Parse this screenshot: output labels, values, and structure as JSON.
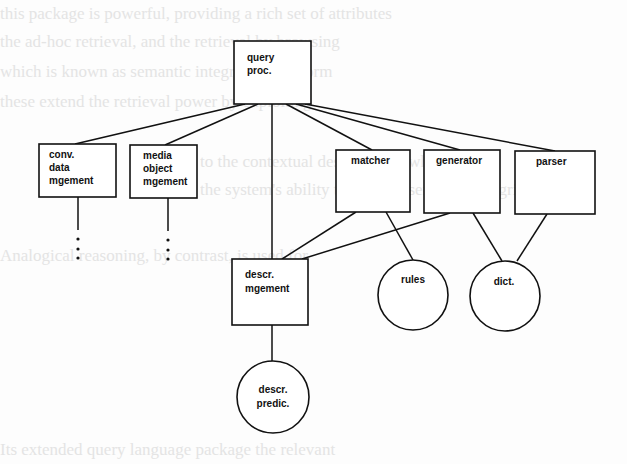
{
  "background_bleed_lines": [
    "this package is powerful, providing a rich set of attributes",
    "the ad-hoc retrieval, and the retrieval by browsing",
    "which is known as semantic integrity in the form",
    "these extend the retrieval power by exploiting",
    "to the contextual descriptions, which assist",
    "the system's ability to manage semantic integrity",
    "Analogical reasoning, by contrast, is used for",
    "Its extended query language package the relevant"
  ],
  "diagram": {
    "nodes": [
      {
        "id": "query_proc",
        "shape": "box",
        "lines": [
          "query",
          "proc."
        ]
      },
      {
        "id": "conv_data",
        "shape": "box",
        "lines": [
          "conv.",
          "data",
          "mgement"
        ]
      },
      {
        "id": "media_object",
        "shape": "box",
        "lines": [
          "media",
          "object",
          "mgement"
        ]
      },
      {
        "id": "matcher",
        "shape": "box",
        "lines": [
          "matcher"
        ]
      },
      {
        "id": "generator",
        "shape": "box",
        "lines": [
          "generator"
        ]
      },
      {
        "id": "parser",
        "shape": "box",
        "lines": [
          "parser"
        ]
      },
      {
        "id": "descr_mgement",
        "shape": "box",
        "lines": [
          "descr.",
          "mgement"
        ]
      },
      {
        "id": "rules",
        "shape": "circle",
        "lines": [
          "rules"
        ]
      },
      {
        "id": "dict",
        "shape": "circle",
        "lines": [
          "dict."
        ]
      },
      {
        "id": "descr_predic",
        "shape": "circle",
        "lines": [
          "descr.",
          "predic."
        ]
      }
    ],
    "edges": [
      [
        "query_proc",
        "conv_data"
      ],
      [
        "query_proc",
        "media_object"
      ],
      [
        "query_proc",
        "descr_mgement"
      ],
      [
        "query_proc",
        "matcher"
      ],
      [
        "query_proc",
        "generator"
      ],
      [
        "query_proc",
        "parser"
      ],
      [
        "matcher",
        "descr_mgement"
      ],
      [
        "generator",
        "descr_mgement"
      ],
      [
        "matcher",
        "rules"
      ],
      [
        "generator",
        "dict"
      ],
      [
        "parser",
        "dict"
      ],
      [
        "descr_mgement",
        "descr_predic"
      ]
    ],
    "continuation_markers": [
      "conv_data",
      "media_object"
    ]
  }
}
